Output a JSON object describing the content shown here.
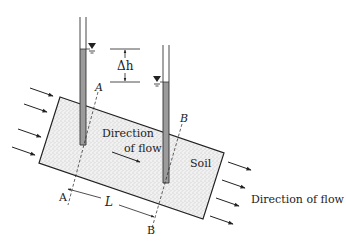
{
  "diagram": {
    "title": "",
    "colors": {
      "soil_fill": "#e9e9e9",
      "soil_stipple": "#9a9a9a",
      "water_fill": "#9b9b9b",
      "line": "#222222"
    },
    "labels": {
      "delta_h": "Δh",
      "point_a_top": "A",
      "point_b_top": "B",
      "point_a_bottom": "A",
      "point_b_bottom": "B",
      "length": "L",
      "direction_inside_line1": "Direction",
      "direction_inside_line2": "of flow",
      "soil": "Soil",
      "direction_outside": "Direction of flow"
    },
    "components": {
      "piezometers": [
        {
          "name": "left-piezometer",
          "point": "A"
        },
        {
          "name": "right-piezometer",
          "point": "B"
        }
      ],
      "inflow_arrows": 4,
      "outflow_arrows": 4
    }
  }
}
